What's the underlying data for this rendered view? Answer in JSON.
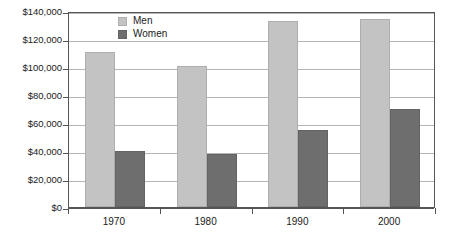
{
  "chart_data": {
    "type": "bar",
    "title": "",
    "subtitle": "",
    "xlabel": "",
    "ylabel": "",
    "categories": [
      "1970",
      "1980",
      "1990",
      "2000"
    ],
    "series": [
      {
        "name": "Men",
        "color": "#c3c3c3",
        "values": [
          111000,
          101000,
          133000,
          134000
        ]
      },
      {
        "name": "Women",
        "color": "#6e6e6e",
        "values": [
          40000,
          38000,
          55000,
          70000
        ]
      }
    ],
    "ylim": [
      0,
      140000
    ],
    "ytick_step": 20000,
    "ytick_labels": [
      "$0",
      "$20,000",
      "$40,000",
      "$60,000",
      "$80,000",
      "$100,000",
      "$120,000",
      "$140,000"
    ],
    "ytick_values": [
      0,
      20000,
      40000,
      60000,
      80000,
      100000,
      120000,
      140000
    ],
    "grid": true,
    "legend_position": "top-left-inside",
    "legend_entries": [
      "Men",
      "Women"
    ]
  }
}
